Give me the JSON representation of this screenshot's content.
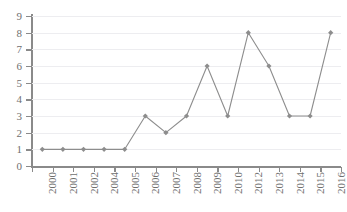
{
  "chart_data": {
    "type": "line",
    "title": "",
    "subtitle": "",
    "xlabel": "",
    "ylabel": "",
    "categories": [
      "2000",
      "2001",
      "2002",
      "2004",
      "2005",
      "2006",
      "2007",
      "2008",
      "2009",
      "2010",
      "2012",
      "2013",
      "2014",
      "2015",
      "2016"
    ],
    "values": [
      1,
      1,
      1,
      1,
      1,
      3,
      2,
      3,
      6,
      3,
      8,
      6,
      3,
      3,
      8
    ],
    "series": [
      {
        "name": "",
        "values": [
          1,
          1,
          1,
          1,
          1,
          3,
          2,
          3,
          6,
          3,
          8,
          6,
          3,
          3,
          8
        ]
      }
    ],
    "ylim": [
      0,
      9
    ],
    "y_ticks": [
      "0",
      "1",
      "2",
      "3",
      "4",
      "5",
      "6",
      "7",
      "8",
      "9"
    ],
    "grid": true,
    "legend": "none",
    "marker": "diamond",
    "colors": {
      "line": "#8d8d8d",
      "marker": "#8d8d8d",
      "gridline": "#ededf0",
      "axis": "#8a8a8a",
      "tick_label": "#6f6f6f",
      "background": "#ffffff"
    },
    "x_label_rotation": "-90"
  }
}
